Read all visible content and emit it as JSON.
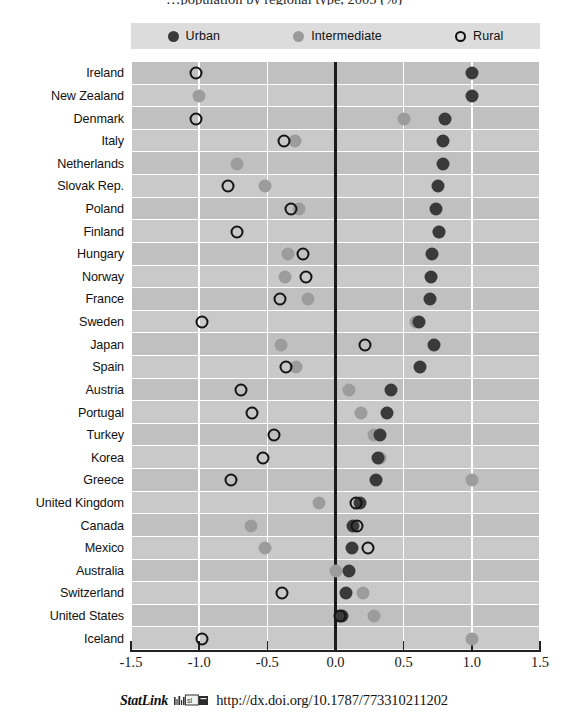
{
  "title": "…population by regional type, 2005 (%)",
  "legend": {
    "position": "top",
    "items": [
      {
        "label": "Urban",
        "icon": "filled-dark-circle-icon",
        "color": "#3a3a3a"
      },
      {
        "label": "Intermediate",
        "icon": "filled-grey-circle-icon",
        "color": "#9c9c9c"
      },
      {
        "label": "Rural",
        "icon": "open-circle-icon",
        "color": "#141414"
      }
    ]
  },
  "footer": {
    "statlink_label": "StatLink",
    "statlink_icon": "statlink-barcode-icon",
    "url": "http://dx.doi.org/10.1787/773310211202"
  },
  "chart_data": {
    "type": "scatter",
    "title": "…population by regional type, 2005 (%)",
    "xlabel": "",
    "ylabel": "",
    "xlim": [
      -1.5,
      1.5
    ],
    "ylim": [
      0,
      26
    ],
    "grid": true,
    "legend_position": "top",
    "xticks": [
      -1.5,
      -1.0,
      -0.5,
      0.0,
      0.5,
      1.0,
      1.5
    ],
    "xticklabels": [
      "-1.5",
      "-1.0",
      "-0.5",
      "0.0",
      "0.5",
      "1.0",
      "1.5"
    ],
    "categories": [
      "Ireland",
      "New Zealand",
      "Denmark",
      "Italy",
      "Netherlands",
      "Slovak Rep.",
      "Poland",
      "Finland",
      "Hungary",
      "Norway",
      "France",
      "Sweden",
      "Japan",
      "Spain",
      "Austria",
      "Portugal",
      "Turkey",
      "Korea",
      "Greece",
      "United Kingdom",
      "Canada",
      "Mexico",
      "Australia",
      "Switzerland",
      "United States",
      "Iceland"
    ],
    "series": [
      {
        "name": "Urban",
        "marker": "filled-dark-circle",
        "color": "#3a3a3a",
        "values": [
          1.0,
          1.0,
          0.8,
          0.79,
          0.79,
          0.75,
          0.74,
          0.76,
          0.71,
          0.7,
          0.69,
          0.61,
          0.72,
          0.62,
          0.41,
          0.38,
          0.33,
          0.31,
          0.3,
          0.18,
          0.13,
          0.12,
          0.1,
          0.08,
          0.05,
          null
        ]
      },
      {
        "name": "Intermediate",
        "marker": "filled-grey-circle",
        "color": "#9c9c9c",
        "values": [
          null,
          -1.0,
          0.5,
          -0.3,
          -0.72,
          -0.52,
          -0.27,
          0.76,
          -0.35,
          -0.37,
          -0.2,
          0.59,
          -0.4,
          -0.29,
          0.1,
          0.19,
          0.28,
          0.33,
          1.0,
          -0.12,
          -0.62,
          -0.52,
          0.0,
          0.2,
          0.28,
          1.0
        ]
      },
      {
        "name": "Rural",
        "marker": "open-circle",
        "color": "#141414",
        "values": [
          -1.02,
          null,
          -1.02,
          -0.38,
          null,
          -0.79,
          -0.33,
          -0.72,
          -0.24,
          -0.22,
          -0.41,
          -0.98,
          0.22,
          -0.36,
          -0.69,
          -0.61,
          -0.45,
          -0.53,
          -0.77,
          0.15,
          0.16,
          0.24,
          null,
          -0.39,
          0.03,
          -0.98
        ]
      }
    ]
  }
}
